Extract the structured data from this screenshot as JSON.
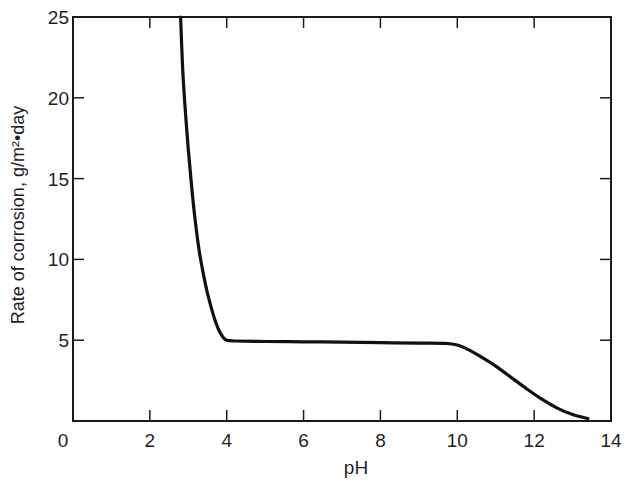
{
  "chart_data": {
    "type": "line",
    "title": "",
    "xlabel": "pH",
    "ylabel": "Rate of corrosion, g/m²•day",
    "xlim": [
      0,
      14
    ],
    "ylim": [
      0,
      25
    ],
    "x_ticks": [
      0,
      2,
      4,
      6,
      8,
      10,
      12,
      14
    ],
    "y_ticks": [
      5,
      10,
      15,
      20,
      25
    ],
    "x_tick_labels": [
      "0",
      "2",
      "4",
      "6",
      "8",
      "10",
      "12",
      "14"
    ],
    "y_tick_labels": [
      "5",
      "10",
      "15",
      "20",
      "25"
    ],
    "grid": false,
    "legend": null,
    "series": [
      {
        "name": "Corrosion rate",
        "color": "#111111",
        "x": [
          2.8,
          2.85,
          2.9,
          3.0,
          3.1,
          3.2,
          3.3,
          3.4,
          3.5,
          3.6,
          3.7,
          3.8,
          3.9,
          4.0,
          4.2,
          5.0,
          6.0,
          7.0,
          8.0,
          9.0,
          9.7,
          10.0,
          10.3,
          10.6,
          11.0,
          11.4,
          11.8,
          12.2,
          12.6,
          13.0,
          13.4
        ],
        "y": [
          25.0,
          22.0,
          20.0,
          16.8,
          14.2,
          12.0,
          10.3,
          9.0,
          7.9,
          7.0,
          6.2,
          5.6,
          5.2,
          5.0,
          4.95,
          4.92,
          4.9,
          4.88,
          4.85,
          4.82,
          4.8,
          4.7,
          4.4,
          4.0,
          3.4,
          2.7,
          2.0,
          1.35,
          0.8,
          0.4,
          0.15
        ]
      }
    ]
  },
  "axes": {
    "xlabel": "pH",
    "ylabel": "Rate of corrosion, g/m²•day"
  }
}
